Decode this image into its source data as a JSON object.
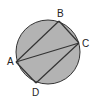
{
  "diagram": {
    "type": "inscribed-quadrilateral",
    "circle": {
      "cx": 48,
      "cy": 52,
      "r": 32,
      "fill": "#b3b3b3",
      "stroke": "#333333"
    },
    "points": [
      {
        "name": "A",
        "x": 16,
        "y": 62,
        "label_x": 7,
        "label_y": 65
      },
      {
        "name": "B",
        "x": 59,
        "y": 21,
        "label_x": 57,
        "label_y": 17
      },
      {
        "name": "C",
        "x": 79,
        "y": 43,
        "label_x": 82,
        "label_y": 47
      },
      {
        "name": "D",
        "x": 36,
        "y": 83,
        "label_x": 32,
        "label_y": 96
      }
    ],
    "segments": [
      [
        "A",
        "B"
      ],
      [
        "B",
        "C"
      ],
      [
        "C",
        "D"
      ],
      [
        "D",
        "A"
      ],
      [
        "A",
        "C"
      ]
    ],
    "line_color": "#333333"
  }
}
